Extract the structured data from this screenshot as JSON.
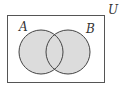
{
  "diagram": {
    "type": "venn",
    "universe_label": "U",
    "sets": [
      {
        "label": "A"
      },
      {
        "label": "B"
      }
    ],
    "shaded_region": "A ∪ B",
    "colors": {
      "fill": "#dcdcdc",
      "stroke": "#444444",
      "background": "#ffffff"
    }
  }
}
